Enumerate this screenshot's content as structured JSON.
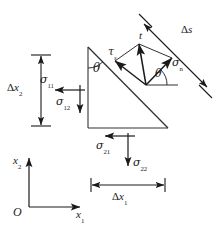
{
  "figure": {
    "type": "stress-element-diagram",
    "colors": {
      "line": "#1a1a1a",
      "background": "#ffffff",
      "label": "#1a1a1a"
    }
  },
  "labels": {
    "traction_vector": "t",
    "shear_stress": "τ",
    "shear_stress_sub": "s",
    "normal_stress": "σ",
    "normal_stress_sub": "n",
    "delta_s": "Δs",
    "delta_s_symbol": "Δ",
    "delta_s_name": "s",
    "delta_x2": "Δx",
    "delta_x2_sub": "2",
    "delta_x1": "Δx",
    "delta_x1_sub": "1",
    "sigma": "σ",
    "sigma_11_sub": "11",
    "sigma_12_sub": "12",
    "sigma_21_sub": "21",
    "sigma_22_sub": "22",
    "theta_face": "θ",
    "theta_vector": "θ",
    "origin": "O",
    "axis_x1": "x",
    "axis_x1_sub": "1",
    "axis_x2": "x",
    "axis_x2_sub": "2"
  },
  "geometry": {
    "triangle": {
      "apex_top": [
        88,
        47
      ],
      "corner_bottom_left": [
        88,
        128
      ],
      "corner_bottom_right": [
        168,
        128
      ]
    },
    "angle_theta_degrees": 45
  }
}
